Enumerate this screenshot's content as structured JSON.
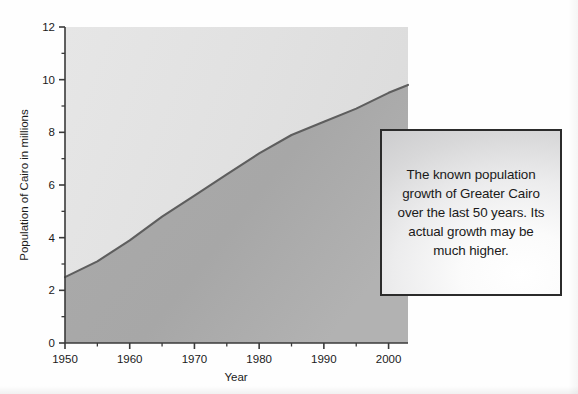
{
  "chart_data": {
    "type": "area",
    "title": "",
    "xlabel": "Year",
    "ylabel": "Population of Cairo in millions",
    "xlim": [
      1950,
      2003
    ],
    "ylim": [
      0,
      12
    ],
    "grid": false,
    "legend": "none",
    "x_major_ticks": [
      1950,
      1960,
      1970,
      1980,
      1990,
      2000
    ],
    "x_minor_ticks": [
      1955,
      1965,
      1975,
      1985,
      1995
    ],
    "y_major_ticks": [
      0,
      2,
      4,
      6,
      8,
      10,
      12
    ],
    "y_minor_ticks": [
      1,
      3,
      5,
      7,
      9,
      11
    ],
    "x_tick_labels": [
      "1950",
      "1960",
      "1970",
      "1980",
      "1990",
      "2000"
    ],
    "y_tick_labels": [
      "0",
      "2",
      "4",
      "6",
      "8",
      "10",
      "12"
    ],
    "series": [
      {
        "name": "Population of Greater Cairo",
        "x": [
          1950,
          1955,
          1960,
          1965,
          1970,
          1975,
          1980,
          1985,
          1990,
          1995,
          2000,
          2003
        ],
        "values": [
          2.5,
          3.1,
          3.9,
          4.8,
          5.6,
          6.4,
          7.2,
          7.9,
          8.4,
          8.9,
          9.5,
          9.8
        ]
      }
    ],
    "area_fill_color": "#a9a9a9",
    "plot_background_color": "#e2e2e2",
    "line_color": "#595959",
    "axis_color": "#3a3a3a"
  },
  "callout": {
    "text": "The known population growth of Greater Cairo over the last 50 years. Its actual growth may be much higher."
  }
}
